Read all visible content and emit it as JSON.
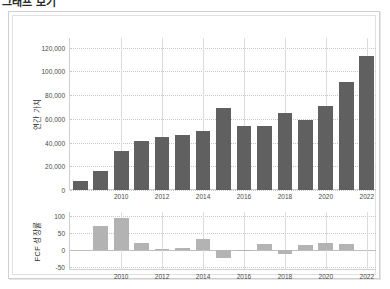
{
  "title": "그래프 보기",
  "colors": {
    "value_bar": "#606060",
    "growth_bar": "#b3b3b3",
    "grid": "#c8c8c8",
    "axis": "#cfcfcf",
    "frame": "#cfcfcf",
    "text": "#4a4a4a"
  },
  "chart_data": [
    {
      "type": "bar",
      "title": "",
      "panel": "upper",
      "ylabel": "연간 가치",
      "xlabel": "",
      "categories": [
        2008,
        2009,
        2010,
        2011,
        2012,
        2013,
        2014,
        2015,
        2016,
        2017,
        2018,
        2019,
        2020,
        2021,
        2022
      ],
      "values": [
        8000,
        16000,
        33000,
        41000,
        45000,
        46000,
        50000,
        69000,
        54000,
        54000,
        65000,
        59000,
        71000,
        91000,
        113000
      ],
      "ylim": [
        0,
        128000
      ],
      "yticks": [
        0,
        20000,
        40000,
        60000,
        80000,
        100000,
        120000
      ],
      "ytick_labels": [
        "0",
        "20,000",
        "40,000",
        "60,000",
        "80,000",
        "100,000",
        "120,000"
      ],
      "xticks": [
        2010,
        2012,
        2014,
        2016,
        2018,
        2020,
        2022
      ],
      "xtick_labels": [
        "2010",
        "2012",
        "2014",
        "2016",
        "2018",
        "2020",
        "2022"
      ],
      "grid": true,
      "legend": "none"
    },
    {
      "type": "bar",
      "title": "",
      "panel": "lower",
      "ylabel": "FCF 성장률",
      "xlabel": "",
      "categories": [
        2008,
        2009,
        2010,
        2011,
        2012,
        2013,
        2014,
        2015,
        2016,
        2017,
        2018,
        2019,
        2020,
        2021,
        2022
      ],
      "values": [
        0,
        72,
        93,
        22,
        4,
        7,
        33,
        -23,
        -3,
        17,
        -11,
        16,
        22,
        17,
        0
      ],
      "ylim": [
        -58,
        112
      ],
      "yticks": [
        -50,
        0,
        50,
        100
      ],
      "ytick_labels": [
        "-50",
        "0",
        "50",
        "100"
      ],
      "xticks": [
        2010,
        2012,
        2014,
        2016,
        2018,
        2020,
        2022
      ],
      "xtick_labels": [
        "2010",
        "2012",
        "2014",
        "2016",
        "2018",
        "2020",
        "2022"
      ],
      "grid": true,
      "legend": "none"
    }
  ]
}
